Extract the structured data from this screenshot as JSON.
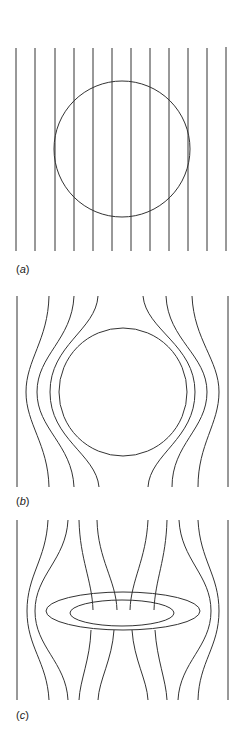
{
  "figure": {
    "line_color": "#333333",
    "panels": [
      {
        "id": "a",
        "label_open": "(",
        "label_letter": "a",
        "label_close": ")",
        "shape": "circle",
        "field_lines": 12
      },
      {
        "id": "b",
        "label_open": "(",
        "label_letter": "b",
        "label_close": ")",
        "shape": "circle",
        "field_lines": 8
      },
      {
        "id": "c",
        "label_open": "(",
        "label_letter": "c",
        "label_close": ")",
        "shape": "ring",
        "field_lines": 12
      }
    ]
  }
}
